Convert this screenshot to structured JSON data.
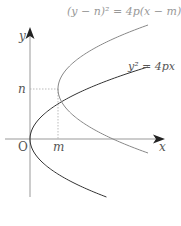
{
  "diagram": {
    "title_equation_shifted": "(y − n)² = 4p(x − m)",
    "equation_standard": "y² = 4px",
    "axes": {
      "x_label": "x",
      "y_label": "y",
      "origin_label": "O"
    },
    "markers": {
      "m_label": "m",
      "n_label": "n"
    },
    "curves": [
      {
        "name": "standard-parabola",
        "equation": "y² = 4px",
        "vertex": "O",
        "color": "#333333"
      },
      {
        "name": "shifted-parabola",
        "equation": "(y − n)² = 4p(x − m)",
        "vertex": "(m, n)",
        "color": "#888888"
      }
    ],
    "colors": {
      "axis": "#999999",
      "standard_curve": "#333333",
      "shifted_curve": "#888888",
      "guide_lines": "#aaaaaa"
    }
  }
}
